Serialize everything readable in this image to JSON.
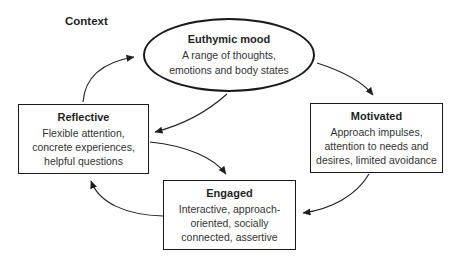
{
  "diagram": {
    "context_label": "Context",
    "nodes": {
      "euthymic": {
        "title": "Euthymic mood",
        "description": "A range of thoughts, emotions and body states"
      },
      "reflective": {
        "title": "Reflective",
        "description": "Flexible attention, concrete experiences, helpful questions"
      },
      "motivated": {
        "title": "Motivated",
        "description": "Approach impulses, attention to needs and desires, limited avoidance"
      },
      "engaged": {
        "title": "Engaged",
        "description": "Interactive, approach-oriented, socially connected, assertive"
      }
    },
    "edges": [
      {
        "from": "reflective",
        "to": "euthymic"
      },
      {
        "from": "euthymic",
        "to": "motivated"
      },
      {
        "from": "euthymic",
        "to": "reflective"
      },
      {
        "from": "reflective",
        "to": "engaged"
      },
      {
        "from": "motivated",
        "to": "engaged"
      },
      {
        "from": "engaged",
        "to": "reflective"
      }
    ],
    "colors": {
      "stroke": "#1f1f1f",
      "background": "#ffffff",
      "text": "#333333"
    }
  }
}
